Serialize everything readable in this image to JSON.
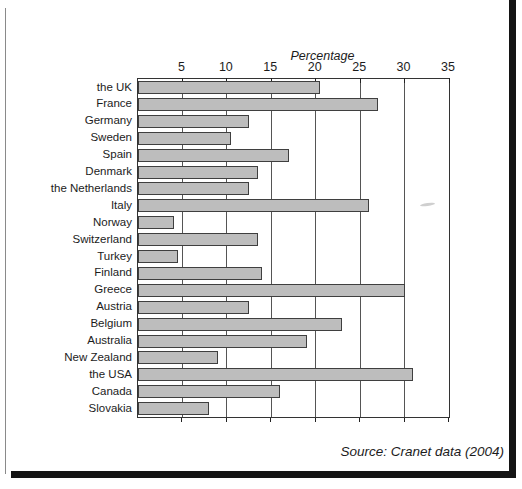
{
  "chart_data": {
    "type": "bar",
    "orientation": "horizontal",
    "title": "Percentage",
    "categories": [
      "the UK",
      "France",
      "Germany",
      "Sweden",
      "Spain",
      "Denmark",
      "the Netherlands",
      "Italy",
      "Norway",
      "Switzerland",
      "Turkey",
      "Finland",
      "Greece",
      "Austria",
      "Belgium",
      "Australia",
      "New Zealand",
      "the USA",
      "Canada",
      "Slovakia"
    ],
    "values": [
      20.5,
      27,
      12.5,
      10.5,
      17,
      13.5,
      12.5,
      26,
      4,
      13.5,
      4.5,
      14,
      30,
      12.5,
      23,
      19,
      9,
      31,
      16,
      8
    ],
    "xlabel": "Percentage",
    "ylabel": "",
    "xlim": [
      0,
      35
    ],
    "xticks": [
      5,
      10,
      15,
      20,
      25,
      30,
      35
    ],
    "grid": "vertical",
    "legend": "none",
    "bar_fill": "#bdbdbd",
    "bar_border": "#3f3f3f",
    "source": "Source: Cranet data (2004)"
  }
}
